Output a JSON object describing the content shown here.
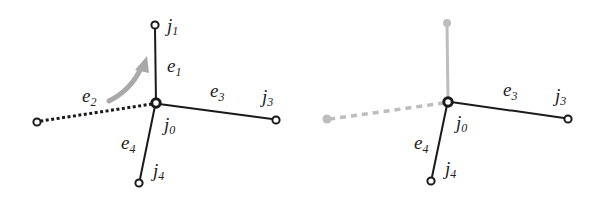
{
  "colors": {
    "edge": "#1a1a1a",
    "faded": "#bdbdbd",
    "arrow": "#a9a9a9",
    "background": "#ffffff"
  },
  "left_panel": {
    "nodes": {
      "j0": {
        "label": "j",
        "sub": "0"
      },
      "j1": {
        "label": "j",
        "sub": "1"
      },
      "j3": {
        "label": "j",
        "sub": "3"
      },
      "j4": {
        "label": "j",
        "sub": "4"
      }
    },
    "edges": {
      "e1": {
        "label": "e",
        "sub": "1",
        "style": "solid"
      },
      "e2": {
        "label": "e",
        "sub": "2",
        "style": "dotted"
      },
      "e3": {
        "label": "e",
        "sub": "3",
        "style": "solid"
      },
      "e4": {
        "label": "e",
        "sub": "4",
        "style": "solid"
      }
    },
    "arrow": "curved rotation arrow from e2 toward e1"
  },
  "right_panel": {
    "nodes": {
      "j0": {
        "label": "j",
        "sub": "0"
      },
      "j3": {
        "label": "j",
        "sub": "3"
      },
      "j4": {
        "label": "j",
        "sub": "4"
      }
    },
    "edges": {
      "e1": {
        "style": "faded"
      },
      "e2": {
        "style": "faded-dashed"
      },
      "e3": {
        "label": "e",
        "sub": "3",
        "style": "solid"
      },
      "e4": {
        "label": "e",
        "sub": "4",
        "style": "solid"
      }
    }
  }
}
